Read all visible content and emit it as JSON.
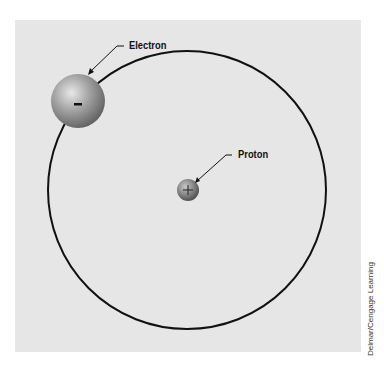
{
  "diagram": {
    "labels": {
      "electron": "Electron",
      "proton": "Proton"
    },
    "symbols": {
      "electron_charge": "-",
      "proton_charge": "+"
    },
    "credit": "Delmar/Cengage Learning",
    "colors": {
      "background": "#e6e6e6",
      "orbit": "#111111",
      "sphere": "#8a8a8a"
    }
  }
}
